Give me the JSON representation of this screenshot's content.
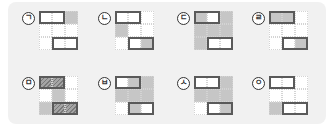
{
  "colors": {
    "panel_bg": "#f1f1f1",
    "white_cell": "#ffffff",
    "gray_cell": "#c6c6c6",
    "hatched_cell": "#8d8d8d",
    "domino_border": "#5a5a5a"
  },
  "legend": {
    "W": "white cell",
    "G": "gray cell",
    "H": "hatched cell"
  },
  "items": [
    {
      "label": "ㄱ",
      "cells": [
        "W",
        "W",
        "G",
        "W",
        "W",
        "W",
        "W",
        "W",
        "W"
      ]
    },
    {
      "label": "ㄴ",
      "cells": [
        "W",
        "W",
        "W",
        "G",
        "W",
        "W",
        "W",
        "W",
        "G"
      ]
    },
    {
      "label": "ㄷ",
      "cells": [
        "G",
        "W",
        "G",
        "G",
        "G",
        "G",
        "G",
        "W",
        "W"
      ]
    },
    {
      "label": "ㄹ",
      "cells": [
        "G",
        "G",
        "W",
        "W",
        "W",
        "W",
        "W",
        "W",
        "G"
      ]
    },
    {
      "label": "ㅁ",
      "cells": [
        "H",
        "H",
        "W",
        "W",
        "G",
        "W",
        "G",
        "H",
        "H"
      ]
    },
    {
      "label": "ㅂ",
      "cells": [
        "W",
        "G",
        "G",
        "G",
        "G",
        "G",
        "W",
        "G",
        "W"
      ]
    },
    {
      "label": "ㅅ",
      "cells": [
        "W",
        "W",
        "G",
        "G",
        "G",
        "G",
        "W",
        "W",
        "G"
      ]
    },
    {
      "label": "ㅇ",
      "cells": [
        "W",
        "W",
        "W",
        "W",
        "W",
        "W",
        "G",
        "W",
        "W"
      ]
    }
  ]
}
